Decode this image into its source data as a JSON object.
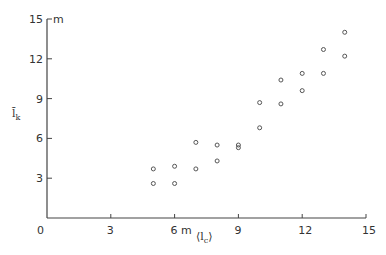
{
  "chart_data": {
    "type": "scatter",
    "title": "",
    "xlabel": "⟨l_c⟩",
    "ylabel": "l̄_k",
    "x_unit": "m",
    "y_unit": "m",
    "xlim": [
      0,
      15
    ],
    "ylim": [
      0,
      15
    ],
    "x_ticks": [
      0,
      3,
      6,
      9,
      12,
      15
    ],
    "y_ticks": [
      3,
      6,
      9,
      12,
      15
    ],
    "x_tick_labels": [
      "0",
      "3",
      "6 m",
      "9",
      "12",
      "15"
    ],
    "y_tick_labels": [
      "3",
      "6",
      "9",
      "12",
      "15"
    ],
    "grid": false,
    "legend": null,
    "marker": "open-circle",
    "series": [
      {
        "name": "data",
        "points": [
          {
            "x": 5,
            "y": 3.7
          },
          {
            "x": 5,
            "y": 2.6
          },
          {
            "x": 6,
            "y": 3.9
          },
          {
            "x": 6,
            "y": 2.6
          },
          {
            "x": 7,
            "y": 5.7
          },
          {
            "x": 7,
            "y": 3.7
          },
          {
            "x": 8,
            "y": 5.5
          },
          {
            "x": 8,
            "y": 4.3
          },
          {
            "x": 9,
            "y": 5.5
          },
          {
            "x": 9,
            "y": 5.3
          },
          {
            "x": 10,
            "y": 8.7
          },
          {
            "x": 10,
            "y": 6.8
          },
          {
            "x": 11,
            "y": 10.4
          },
          {
            "x": 11,
            "y": 8.6
          },
          {
            "x": 12,
            "y": 10.9
          },
          {
            "x": 12,
            "y": 9.6
          },
          {
            "x": 13,
            "y": 12.7
          },
          {
            "x": 13,
            "y": 10.9
          },
          {
            "x": 14,
            "y": 14.0
          },
          {
            "x": 14,
            "y": 12.2
          }
        ]
      }
    ]
  },
  "labels": {
    "y_unit": "m",
    "x_axis": "⟨l",
    "x_axis_sub": "c",
    "x_axis_close": "⟩",
    "y_axis": "l̄",
    "y_axis_sub": "k"
  }
}
